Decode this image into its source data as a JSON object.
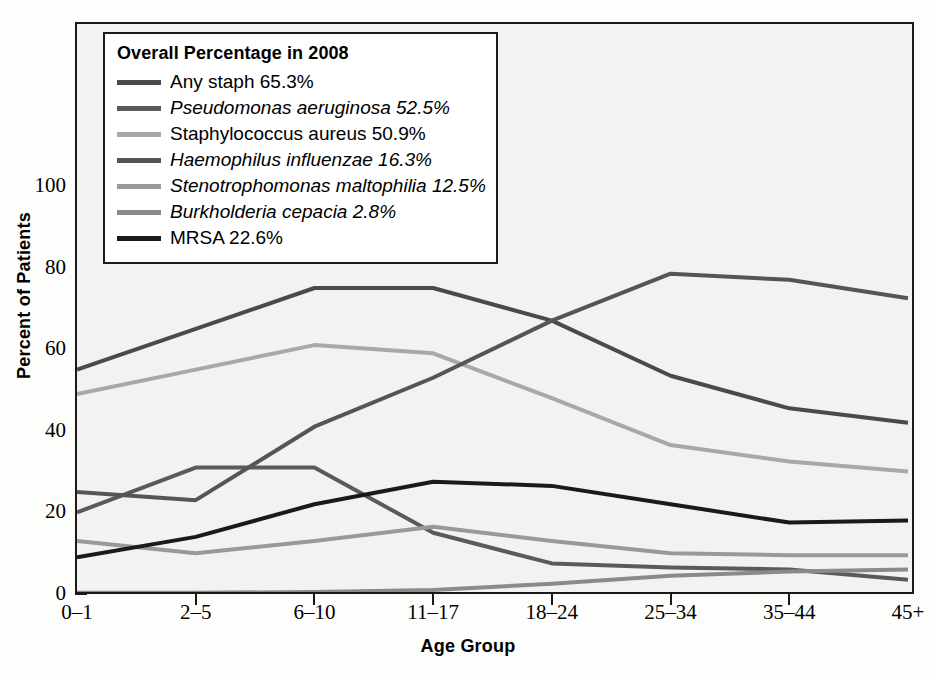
{
  "chart_data": {
    "type": "line",
    "title": "",
    "xlabel": "Age Group",
    "ylabel": "Percent of Patients",
    "categories": [
      "0–1",
      "2–5",
      "6–10",
      "11–17",
      "18–24",
      "25–34",
      "35–44",
      "45+"
    ],
    "ylim": [
      0,
      110
    ],
    "yticks": [
      0,
      20,
      40,
      60,
      80,
      100
    ],
    "ytick_labels": [
      "0",
      "20",
      "40",
      "60",
      "80",
      "100"
    ],
    "grid": false,
    "legend_position": "upper-left-inset",
    "legend_title": "Overall Percentage in 2008",
    "series": [
      {
        "name": "Any staph",
        "label": "Any staph 65.3%",
        "overall_percentage": "65.3%",
        "italic": false,
        "color": "#4a4a4a",
        "values": [
          55,
          65,
          75,
          75,
          67,
          53.5,
          45.5,
          42
        ]
      },
      {
        "name": "Pseudomonas aeruginosa",
        "label": "Pseudomonas aeruginosa 52.5%",
        "overall_percentage": "52.5%",
        "italic": true,
        "color": "#5a5a5a",
        "values": [
          20,
          31,
          31,
          15,
          7.5,
          6.5,
          6,
          3.5
        ]
      },
      {
        "name": "Staphylococcus aureus",
        "label": "Staphylococcus aureus 50.9%",
        "overall_percentage": "50.9%",
        "italic": false,
        "color": "#a8a8a8",
        "values": [
          49,
          55,
          61,
          59,
          48,
          36.5,
          32.5,
          30
        ]
      },
      {
        "name": "Haemophilus influenzae",
        "label": "Haemophilus influenzae 16.3%",
        "overall_percentage": "16.3%",
        "italic": true,
        "color": "#555555",
        "values": [
          25,
          23,
          41,
          53,
          67,
          78.5,
          77,
          72.5
        ]
      },
      {
        "name": "Stenotrophomonas maltophilia",
        "label": "Stenotrophomonas maltophilia 12.5%",
        "overall_percentage": "12.5%",
        "italic": true,
        "color": "#999999",
        "values": [
          13,
          10,
          13,
          16.5,
          13,
          10,
          9.5,
          9.5
        ]
      },
      {
        "name": "Burkholderia cepacia",
        "label": "Burkholderia cepacia 2.8%",
        "overall_percentage": "2.8%",
        "italic": true,
        "color": "#8a8a8a",
        "values": [
          0.3,
          0.3,
          0.5,
          1,
          2.5,
          4.5,
          5.5,
          6
        ]
      },
      {
        "name": "MRSA",
        "label": "MRSA 22.6%",
        "overall_percentage": "22.6%",
        "italic": false,
        "color": "#1a1a1a",
        "values": [
          9,
          14,
          22,
          27.5,
          26.5,
          22,
          17.5,
          18
        ]
      }
    ]
  }
}
